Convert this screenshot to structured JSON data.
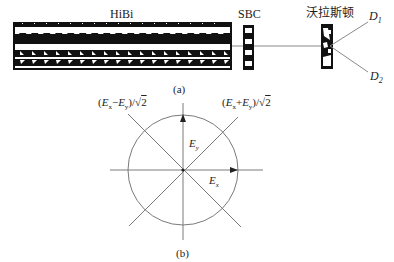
{
  "panel_a": {
    "caption": "(a)",
    "hibi_label": "HiBi",
    "sbc_label": "SBC",
    "wollaston_label": "沃拉斯顿",
    "detector1": {
      "symbol": "D",
      "sub": "1"
    },
    "detector2": {
      "symbol": "D",
      "sub": "2"
    }
  },
  "panel_b": {
    "caption": "(b)",
    "axis_y_label": {
      "symbol": "E",
      "sub": "y"
    },
    "axis_x_label": {
      "symbol": "E",
      "sub": "x"
    },
    "diag_left_label": "(Ex−Ey)/√2",
    "diag_right_label": "(Ex+Ey)/√2"
  },
  "colors": {
    "line": "#7a7a7a",
    "ink": "#111111",
    "background": "#ffffff"
  }
}
